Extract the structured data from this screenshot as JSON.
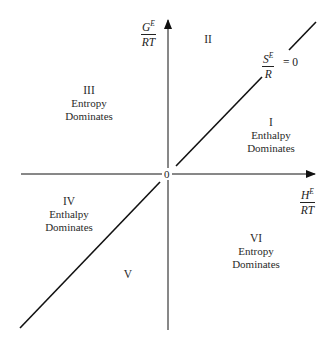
{
  "axes": {
    "y_label": {
      "numerator": "G",
      "numerator_sup": "E",
      "denominator": "RT"
    },
    "x_label": {
      "numerator": "H",
      "numerator_sup": "E",
      "denominator": "RT"
    },
    "origin_label": "0"
  },
  "diagonal": {
    "label": {
      "numerator": "S",
      "numerator_sup": "E",
      "denominator": "R",
      "equals": "= 0"
    }
  },
  "regions": [
    {
      "id": "I",
      "numeral": "I",
      "line1": "Enthalpy",
      "line2": "Dominates"
    },
    {
      "id": "II",
      "numeral": "II",
      "line1": "",
      "line2": ""
    },
    {
      "id": "III",
      "numeral": "III",
      "line1": "Entropy",
      "line2": "Dominates"
    },
    {
      "id": "IV",
      "numeral": "IV",
      "line1": "Enthalpy",
      "line2": "Dominates"
    },
    {
      "id": "V",
      "numeral": "V",
      "line1": "",
      "line2": ""
    },
    {
      "id": "VI",
      "numeral": "VI",
      "line1": "Entropy",
      "line2": "Dominates"
    }
  ],
  "colors": {
    "line": "#111111",
    "text": "#222222",
    "background": "#ffffff"
  }
}
